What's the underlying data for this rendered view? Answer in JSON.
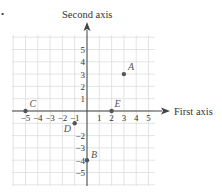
{
  "bullet": "•",
  "axes": {
    "first_axis_label": "First axis",
    "second_axis_label": "Second axis",
    "x_range": [
      -5,
      5
    ],
    "y_range": [
      -5,
      5
    ]
  },
  "x_ticks": [
    "−5",
    "−4",
    "−3",
    "−2",
    "−1",
    "1",
    "2",
    "3",
    "4",
    "5"
  ],
  "y_ticks": [
    "5",
    "4",
    "3",
    "2",
    "1",
    "−2",
    "−3",
    "−4",
    "−5"
  ],
  "points": [
    {
      "label": "A",
      "x": 3,
      "y": 3
    },
    {
      "label": "B",
      "x": 0,
      "y": -4
    },
    {
      "label": "C",
      "x": -5,
      "y": 0
    },
    {
      "label": "D",
      "x": -1,
      "y": -1
    },
    {
      "label": "E",
      "x": 2,
      "y": 0
    }
  ],
  "colors": {
    "grid": "#d8d8d8",
    "axis": "#444444",
    "point": "#555555",
    "point_label": "#555555"
  }
}
